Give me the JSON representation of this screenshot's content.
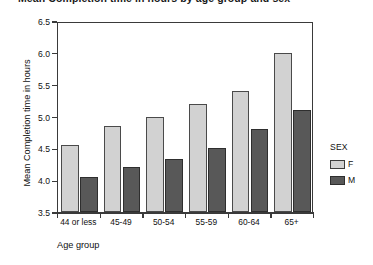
{
  "chart_data": {
    "type": "bar",
    "title": "Mean Completion time in hours by age group and sex",
    "xlabel": "Age group",
    "ylabel": "Mean Completion time in hours",
    "ylim": [
      3.5,
      6.5
    ],
    "ytick_step": 0.5,
    "grid": false,
    "legend_position": "right",
    "legend_title": "SEX",
    "categories": [
      "44 or less",
      "45-49",
      "50-54",
      "55-59",
      "60-64",
      "65+"
    ],
    "yticks": [
      "3.5",
      "4.0",
      "4.5",
      "5.0",
      "5.5",
      "6.0",
      "6.5"
    ],
    "series": [
      {
        "name": "F",
        "color": "#d2d2d2",
        "values": [
          4.55,
          4.85,
          5.0,
          5.2,
          5.4,
          6.0
        ]
      },
      {
        "name": "M",
        "color": "#585858",
        "values": [
          4.05,
          4.2,
          4.33,
          4.5,
          4.8,
          5.1
        ]
      }
    ]
  },
  "axes": {
    "y_title": "Mean Completion time in hours",
    "x_title": "Age group"
  },
  "legend": {
    "title": "SEX",
    "entries": [
      {
        "label": "F"
      },
      {
        "label": "M"
      }
    ]
  }
}
